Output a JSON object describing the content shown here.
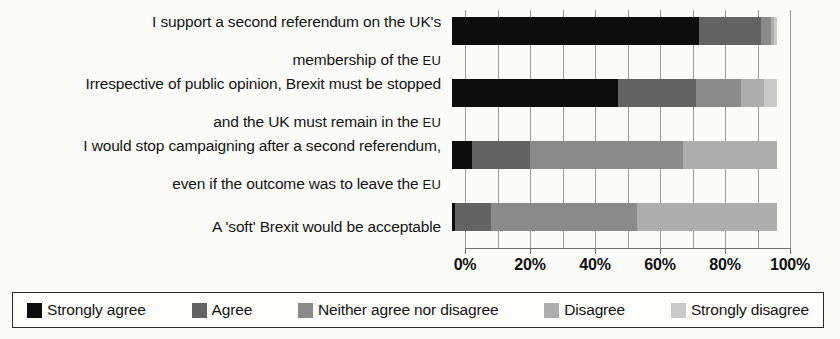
{
  "chart_data": {
    "type": "bar",
    "subtype": "stacked-horizontal-100",
    "title": "",
    "xlabel": "",
    "ylabel": "",
    "xlim": [
      0,
      100
    ],
    "grid": true,
    "legend_position": "bottom",
    "xticks": [
      {
        "value": 0,
        "label": "0%"
      },
      {
        "value": 20,
        "label": "20%"
      },
      {
        "value": 40,
        "label": "40%"
      },
      {
        "value": 60,
        "label": "60%"
      },
      {
        "value": 80,
        "label": "80%"
      },
      {
        "value": 100,
        "label": "100%"
      }
    ],
    "gridline_values": [
      0,
      10,
      20,
      30,
      40,
      50,
      60,
      70,
      80,
      90,
      100
    ],
    "categories": [
      "I support a second referendum on the UK's\nmembership of the EU",
      "Irrespective of public opinion, Brexit must be stopped\nand the UK must remain in the EU",
      "I would stop campaigning after a second referendum,\neven if the outcome was to leave the EU",
      "A 'soft' Brexit would be acceptable"
    ],
    "series": [
      {
        "name": "Strongly agree",
        "color": "#0d0d0d",
        "values": [
          76,
          51,
          6,
          1
        ]
      },
      {
        "name": "Agree",
        "color": "#636363",
        "values": [
          19,
          24,
          18,
          11
        ]
      },
      {
        "name": "Neither agree nor disagree",
        "color": "#8a8a8a",
        "values": [
          3,
          14,
          47,
          45
        ]
      },
      {
        "name": "Disagree",
        "color": "#adadad",
        "values": [
          1,
          7,
          29,
          43
        ]
      },
      {
        "name": "Strongly disagree",
        "color": "#c9c9c9",
        "values": [
          1,
          4,
          0,
          0
        ]
      }
    ]
  },
  "legend": {
    "items": [
      {
        "label": "Strongly agree",
        "color": "#0d0d0d"
      },
      {
        "label": "Agree",
        "color": "#636363"
      },
      {
        "label": "Neither agree nor disagree",
        "color": "#8a8a8a"
      },
      {
        "label": "Disagree",
        "color": "#adadad"
      },
      {
        "label": "Strongly disagree",
        "color": "#c9c9c9"
      }
    ]
  },
  "categories_display": [
    {
      "line1": "I support a second referendum on the UK's",
      "line2_pre": "membership of the ",
      "line2_sc": "EU"
    },
    {
      "line1": "Irrespective of public opinion, Brexit must be stopped",
      "line2_pre": "and the UK must remain in the ",
      "line2_sc": "EU"
    },
    {
      "line1": "I would stop campaigning after a second referendum,",
      "line2_pre": "even if the outcome was to leave the ",
      "line2_sc": "EU"
    },
    {
      "line1": "A 'soft' Brexit would be acceptable",
      "line2_pre": "",
      "line2_sc": ""
    }
  ]
}
